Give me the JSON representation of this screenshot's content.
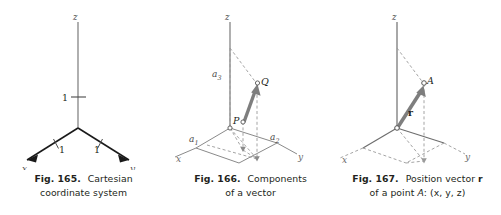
{
  "sheet": {
    "background_color": "#ffffff",
    "ink_color": "#231f20",
    "line_color": "#6e6e6e",
    "vector_color": "#7b7b7b",
    "figure_count": 3
  },
  "figures": [
    {
      "id": "fig-165",
      "number": "Fig. 165.",
      "title": "Cartesian",
      "caption_line2": "coordinate system",
      "axis_labels": {
        "x": "x",
        "y": "y",
        "z": "z"
      },
      "tick_labels": {
        "z_unit": "1",
        "x_unit": "1",
        "y_unit": "1"
      }
    },
    {
      "id": "fig-166",
      "number": "Fig. 166.",
      "title": "Components",
      "caption_line2": "of a vector",
      "axis_labels": {
        "x": "x",
        "y": "y",
        "z": "z"
      },
      "component_labels": {
        "a1": "a",
        "a1_sub": "1",
        "a2": "a",
        "a2_sub": "2",
        "a3": "a",
        "a3_sub": "3"
      },
      "point_labels": {
        "start": "P",
        "end": "Q"
      }
    },
    {
      "id": "fig-167",
      "number": "Fig. 167.",
      "title": "Position vector",
      "title_vector": "r",
      "caption_line2_prefix": "of a point ",
      "caption_line2_point": "A",
      "caption_line2_coords": ": (x, y, z)",
      "axis_labels": {
        "x": "x",
        "y": "y",
        "z": "z"
      },
      "vector_label": "r",
      "point_labels": {
        "end": "A"
      }
    }
  ]
}
